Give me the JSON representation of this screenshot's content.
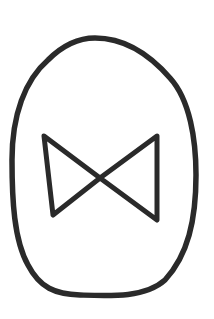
{
  "drawing": {
    "description": "Hand-drawn symbol: egg-shaped oval containing a bowtie (two triangles meeting at center)",
    "stroke_color": "#2a2a2a",
    "background_color": "#ffffff",
    "stroke_width": 5
  }
}
